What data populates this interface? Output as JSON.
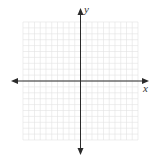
{
  "diagram": {
    "type": "coordinate-plane",
    "x_axis_label": "x",
    "y_axis_label": "y",
    "x_range": [
      -10,
      10
    ],
    "y_range": [
      -10,
      10
    ],
    "grid_step": 1,
    "colors": {
      "grid": "#e3e3e3",
      "axis": "#2b2b2b",
      "background": "#ffffff"
    }
  }
}
